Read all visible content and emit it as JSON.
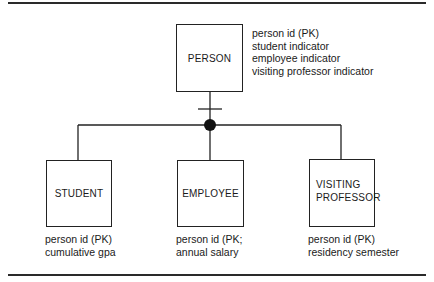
{
  "diagram": {
    "type": "entity-relationship subtype hierarchy",
    "supertype": {
      "name": "PERSON",
      "attributes": [
        "person id (PK)",
        "student indicator",
        "employee indicator",
        "visiting professor indicator"
      ]
    },
    "subtypes": [
      {
        "name": "STUDENT",
        "attributes": [
          "person id (PK)",
          "cumulative gpa"
        ]
      },
      {
        "name": "EMPLOYEE",
        "attributes": [
          "person id (PK;",
          "annual salary"
        ]
      },
      {
        "name_lines": [
          "VISITING",
          "PROFESSOR"
        ],
        "attributes": [
          "person id (PK)",
          "residency semester"
        ]
      }
    ],
    "relationship": {
      "kind": "subtype/category",
      "symbols": [
        "single-bar",
        "filled-circle"
      ]
    }
  }
}
